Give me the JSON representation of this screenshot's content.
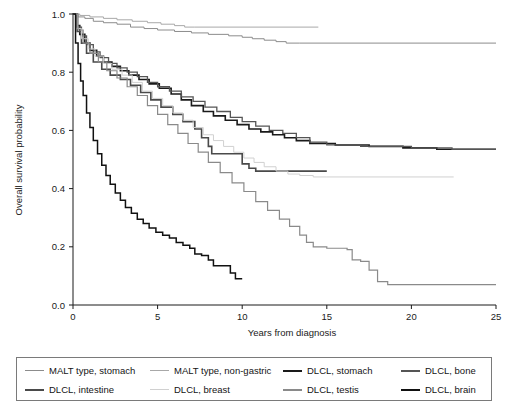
{
  "chart_data": {
    "type": "line",
    "title": "",
    "xlabel": "Years from diagnosis",
    "ylabel": "Overall survival probability",
    "xlim": [
      0,
      25
    ],
    "ylim": [
      0.0,
      1.0
    ],
    "xticks": [
      "0",
      "5",
      "10",
      "15",
      "20",
      "25"
    ],
    "yticks": [
      "0.0",
      "0.2",
      "0.4",
      "0.6",
      "0.8",
      "1.0"
    ],
    "grid": false,
    "legend_position": "below-plot",
    "curve_style": "kaplan-meier step",
    "series": [
      {
        "name": "MALT type, stomach",
        "color": "#8c8c8c",
        "width": 1.0,
        "final_value": 0.9,
        "points": [
          [
            0,
            1.0
          ],
          [
            0.3,
            0.99
          ],
          [
            0.7,
            0.985
          ],
          [
            1.2,
            0.975
          ],
          [
            1.8,
            0.97
          ],
          [
            2.6,
            0.965
          ],
          [
            3.4,
            0.955
          ],
          [
            4.2,
            0.95
          ],
          [
            5.0,
            0.945
          ],
          [
            6.0,
            0.94
          ],
          [
            7.0,
            0.935
          ],
          [
            8.0,
            0.93
          ],
          [
            9.2,
            0.925
          ],
          [
            10.0,
            0.92
          ],
          [
            10.6,
            0.915
          ],
          [
            11.3,
            0.91
          ],
          [
            12.0,
            0.905
          ],
          [
            12.6,
            0.9
          ],
          [
            13.4,
            0.9
          ],
          [
            25,
            0.9
          ]
        ]
      },
      {
        "name": "MALT type, non-gastric",
        "color": "#a8a8a8",
        "width": 1.0,
        "final_value": 0.955,
        "points": [
          [
            0,
            1.0
          ],
          [
            0.4,
            0.995
          ],
          [
            1.0,
            0.99
          ],
          [
            1.8,
            0.985
          ],
          [
            2.6,
            0.98
          ],
          [
            3.5,
            0.975
          ],
          [
            4.4,
            0.97
          ],
          [
            5.2,
            0.965
          ],
          [
            6.0,
            0.96
          ],
          [
            6.6,
            0.955
          ],
          [
            7.2,
            0.955
          ],
          [
            14.5,
            0.955
          ]
        ]
      },
      {
        "name": "DLCL, stomach",
        "color": "#1a1a1a",
        "width": 1.6,
        "final_value": 0.535,
        "points": [
          [
            0,
            1.0
          ],
          [
            0.2,
            0.96
          ],
          [
            0.4,
            0.93
          ],
          [
            0.7,
            0.9
          ],
          [
            1.0,
            0.875
          ],
          [
            1.4,
            0.855
          ],
          [
            1.8,
            0.835
          ],
          [
            2.3,
            0.82
          ],
          [
            2.8,
            0.805
          ],
          [
            3.3,
            0.79
          ],
          [
            3.9,
            0.775
          ],
          [
            4.5,
            0.76
          ],
          [
            5.1,
            0.745
          ],
          [
            5.8,
            0.725
          ],
          [
            6.4,
            0.705
          ],
          [
            7.0,
            0.685
          ],
          [
            7.7,
            0.665
          ],
          [
            8.3,
            0.65
          ],
          [
            9.0,
            0.635
          ],
          [
            9.7,
            0.62
          ],
          [
            10.4,
            0.605
          ],
          [
            11.1,
            0.595
          ],
          [
            11.8,
            0.585
          ],
          [
            12.5,
            0.575
          ],
          [
            13.2,
            0.565
          ],
          [
            14.0,
            0.555
          ],
          [
            15.5,
            0.55
          ],
          [
            17.5,
            0.545
          ],
          [
            19.5,
            0.54
          ],
          [
            21.5,
            0.535
          ],
          [
            22.5,
            0.535
          ],
          [
            25,
            0.535
          ]
        ]
      },
      {
        "name": "DLCL, bone",
        "color": "#555555",
        "width": 1.3,
        "final_value": 0.535,
        "points": [
          [
            0,
            1.0
          ],
          [
            0.2,
            0.955
          ],
          [
            0.5,
            0.925
          ],
          [
            0.8,
            0.895
          ],
          [
            1.2,
            0.87
          ],
          [
            1.6,
            0.85
          ],
          [
            2.1,
            0.83
          ],
          [
            2.6,
            0.815
          ],
          [
            3.2,
            0.8
          ],
          [
            3.8,
            0.785
          ],
          [
            4.4,
            0.765
          ],
          [
            5.0,
            0.75
          ],
          [
            5.7,
            0.735
          ],
          [
            6.4,
            0.715
          ],
          [
            7.1,
            0.7
          ],
          [
            7.8,
            0.68
          ],
          [
            8.5,
            0.665
          ],
          [
            9.3,
            0.645
          ],
          [
            10.0,
            0.63
          ],
          [
            10.8,
            0.615
          ],
          [
            11.6,
            0.6
          ],
          [
            12.4,
            0.59
          ],
          [
            13.2,
            0.575
          ],
          [
            14.0,
            0.56
          ],
          [
            15.0,
            0.55
          ],
          [
            17.0,
            0.545
          ],
          [
            20.0,
            0.54
          ],
          [
            22.4,
            0.535
          ],
          [
            25,
            0.535
          ]
        ]
      },
      {
        "name": "DLCL, intestine",
        "color": "#4a4a4a",
        "width": 1.6,
        "final_value": 0.46,
        "points": [
          [
            0,
            1.0
          ],
          [
            0.25,
            0.94
          ],
          [
            0.5,
            0.9
          ],
          [
            0.8,
            0.865
          ],
          [
            1.2,
            0.835
          ],
          [
            1.7,
            0.81
          ],
          [
            2.2,
            0.79
          ],
          [
            2.8,
            0.775
          ],
          [
            3.4,
            0.755
          ],
          [
            4.0,
            0.73
          ],
          [
            4.6,
            0.705
          ],
          [
            5.2,
            0.68
          ],
          [
            5.9,
            0.655
          ],
          [
            6.5,
            0.63
          ],
          [
            7.2,
            0.605
          ],
          [
            7.6,
            0.575
          ],
          [
            8.0,
            0.545
          ],
          [
            8.2,
            0.52
          ],
          [
            8.5,
            0.52
          ],
          [
            9.5,
            0.52
          ],
          [
            10.0,
            0.485
          ],
          [
            10.4,
            0.47
          ],
          [
            10.8,
            0.46
          ],
          [
            12.0,
            0.46
          ],
          [
            15.0,
            0.46
          ]
        ]
      },
      {
        "name": "DLCL, breast",
        "color": "#d0d0d0",
        "width": 1.0,
        "final_value": 0.44,
        "points": [
          [
            0,
            1.0
          ],
          [
            0.25,
            0.95
          ],
          [
            0.5,
            0.915
          ],
          [
            0.9,
            0.88
          ],
          [
            1.3,
            0.855
          ],
          [
            1.8,
            0.83
          ],
          [
            2.3,
            0.81
          ],
          [
            2.9,
            0.79
          ],
          [
            3.5,
            0.765
          ],
          [
            4.1,
            0.735
          ],
          [
            4.7,
            0.71
          ],
          [
            5.3,
            0.685
          ],
          [
            5.9,
            0.66
          ],
          [
            6.5,
            0.635
          ],
          [
            7.1,
            0.61
          ],
          [
            7.7,
            0.585
          ],
          [
            8.3,
            0.565
          ],
          [
            8.9,
            0.545
          ],
          [
            9.5,
            0.525
          ],
          [
            10.1,
            0.505
          ],
          [
            10.7,
            0.49
          ],
          [
            11.3,
            0.475
          ],
          [
            12.0,
            0.46
          ],
          [
            12.7,
            0.45
          ],
          [
            13.4,
            0.445
          ],
          [
            14.2,
            0.44
          ],
          [
            15.0,
            0.44
          ],
          [
            22.5,
            0.44
          ]
        ]
      },
      {
        "name": "DLCL, testis",
        "color": "#8a8a8a",
        "width": 1.2,
        "final_value": 0.07,
        "points": [
          [
            0,
            1.0
          ],
          [
            0.3,
            0.945
          ],
          [
            0.6,
            0.9
          ],
          [
            1.0,
            0.865
          ],
          [
            1.5,
            0.835
          ],
          [
            2.0,
            0.805
          ],
          [
            2.6,
            0.78
          ],
          [
            3.2,
            0.75
          ],
          [
            3.8,
            0.72
          ],
          [
            4.4,
            0.685
          ],
          [
            5.0,
            0.655
          ],
          [
            5.6,
            0.62
          ],
          [
            6.2,
            0.59
          ],
          [
            6.8,
            0.555
          ],
          [
            7.4,
            0.525
          ],
          [
            8.0,
            0.49
          ],
          [
            8.7,
            0.455
          ],
          [
            9.4,
            0.42
          ],
          [
            10.1,
            0.39
          ],
          [
            10.8,
            0.355
          ],
          [
            11.5,
            0.325
          ],
          [
            12.2,
            0.295
          ],
          [
            12.8,
            0.27
          ],
          [
            13.4,
            0.24
          ],
          [
            13.8,
            0.215
          ],
          [
            14.2,
            0.2
          ],
          [
            15.0,
            0.195
          ],
          [
            16.2,
            0.19
          ],
          [
            16.5,
            0.155
          ],
          [
            17.0,
            0.15
          ],
          [
            17.5,
            0.12
          ],
          [
            18.0,
            0.08
          ],
          [
            18.6,
            0.07
          ],
          [
            20,
            0.07
          ],
          [
            25,
            0.07
          ]
        ]
      },
      {
        "name": "DLCL, brain",
        "color": "#111111",
        "width": 1.5,
        "final_value": 0.09,
        "points": [
          [
            0,
            1.0
          ],
          [
            0.15,
            0.9
          ],
          [
            0.3,
            0.83
          ],
          [
            0.45,
            0.77
          ],
          [
            0.6,
            0.72
          ],
          [
            0.8,
            0.66
          ],
          [
            1.0,
            0.61
          ],
          [
            1.2,
            0.565
          ],
          [
            1.45,
            0.52
          ],
          [
            1.7,
            0.48
          ],
          [
            1.95,
            0.445
          ],
          [
            2.2,
            0.415
          ],
          [
            2.5,
            0.385
          ],
          [
            2.8,
            0.36
          ],
          [
            3.1,
            0.335
          ],
          [
            3.45,
            0.315
          ],
          [
            3.8,
            0.295
          ],
          [
            4.15,
            0.28
          ],
          [
            4.5,
            0.265
          ],
          [
            4.9,
            0.25
          ],
          [
            5.3,
            0.24
          ],
          [
            5.7,
            0.23
          ],
          [
            6.1,
            0.215
          ],
          [
            6.5,
            0.205
          ],
          [
            6.9,
            0.195
          ],
          [
            7.2,
            0.175
          ],
          [
            7.6,
            0.17
          ],
          [
            8.0,
            0.155
          ],
          [
            8.3,
            0.135
          ],
          [
            9.0,
            0.135
          ],
          [
            9.3,
            0.11
          ],
          [
            9.6,
            0.09
          ],
          [
            10.0,
            0.09
          ]
        ]
      }
    ]
  },
  "axes": {
    "ylabel": "Overall survival probability",
    "xlabel": "Years from diagnosis",
    "xticks": [
      "0",
      "5",
      "10",
      "15",
      "20",
      "25"
    ],
    "yticks": [
      "0.0",
      "0.2",
      "0.4",
      "0.6",
      "0.8",
      "1.0"
    ]
  },
  "legend": {
    "items": [
      {
        "label": "MALT type, stomach",
        "color": "#8c8c8c",
        "thickness": "1.6px"
      },
      {
        "label": "MALT type, non-gastric",
        "color": "#a8a8a8",
        "thickness": "1.6px"
      },
      {
        "label": "DLCL, stomach",
        "color": "#1a1a1a",
        "thickness": "2.6px"
      },
      {
        "label": "DLCL, bone",
        "color": "#555555",
        "thickness": "2.2px"
      },
      {
        "label": "DLCL, intestine",
        "color": "#4a4a4a",
        "thickness": "2.6px"
      },
      {
        "label": "DLCL, breast",
        "color": "#d0d0d0",
        "thickness": "1.6px"
      },
      {
        "label": "DLCL, testis",
        "color": "#8a8a8a",
        "thickness": "2.2px"
      },
      {
        "label": "DLCL, brain",
        "color": "#111111",
        "thickness": "2.8px"
      }
    ]
  }
}
